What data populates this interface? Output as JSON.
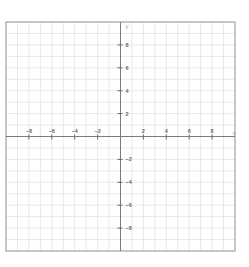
{
  "chart_data": {
    "type": "line",
    "title": "",
    "xlabel": "x",
    "ylabel": "y",
    "xlim": [
      -10,
      10
    ],
    "ylim": [
      -10,
      10
    ],
    "grid": true,
    "grid_step": 1,
    "x_ticks": [
      -8,
      -6,
      -4,
      -2,
      2,
      4,
      6,
      8
    ],
    "x_tick_labels": [
      "−8",
      "−6",
      "−4",
      "−2",
      "2",
      "4",
      "6",
      "8"
    ],
    "y_ticks": [
      8,
      6,
      4,
      2,
      -2,
      -4,
      -6,
      -8
    ],
    "y_tick_labels": [
      "8",
      "6",
      "4",
      "2",
      "−2",
      "−4",
      "−6",
      "−8"
    ],
    "series": [],
    "colors": {
      "grid": "#e2e2e2",
      "axis": "#7a7a7a",
      "label": "#6a6a6a"
    }
  }
}
